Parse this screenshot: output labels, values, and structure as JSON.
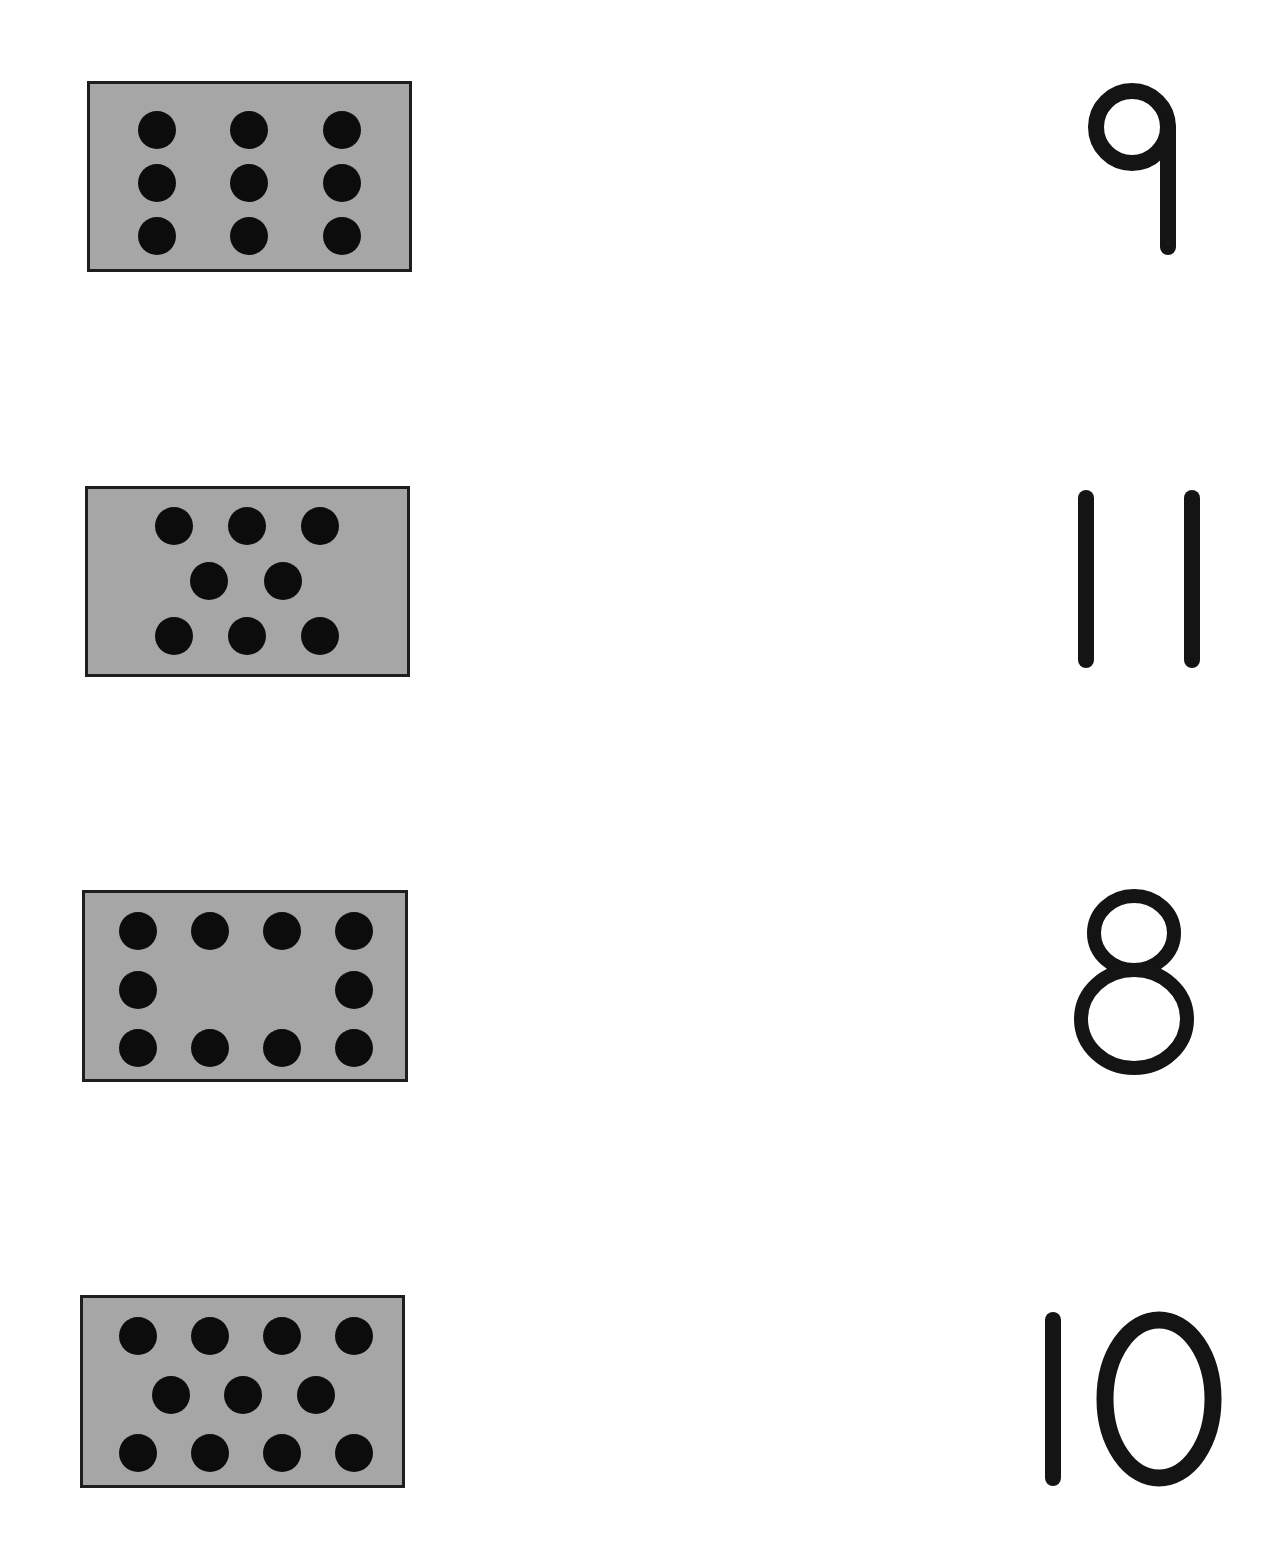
{
  "worksheet": {
    "colors": {
      "card_fill": "#a6a6a6",
      "card_border": "#1e1e1e",
      "dot": "#0c0c0c",
      "numeral": "#141414",
      "background": "#ffffff"
    },
    "rows": [
      {
        "dot_count": 9,
        "numeral": "9",
        "dot_layout": "3 rows x 3 columns"
      },
      {
        "dot_count": 8,
        "numeral": "11",
        "dot_layout": "3 top, 2 middle, 3 bottom"
      },
      {
        "dot_count": 10,
        "numeral": "8",
        "dot_layout": "4 top, 1 left + 1 right middle, 4 bottom"
      },
      {
        "dot_count": 11,
        "numeral": "10",
        "dot_layout": "4 top, 3 middle, 4 bottom"
      }
    ]
  }
}
